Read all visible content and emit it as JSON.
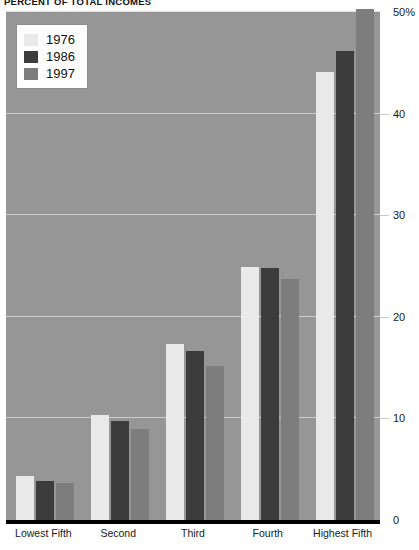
{
  "chart_data": {
    "type": "bar",
    "title": "PERCENT OF TOTAL INCOMES",
    "xlabel": "",
    "ylabel": "",
    "ylim": [
      0,
      50
    ],
    "grid": true,
    "legend_position": "top-left",
    "categories": [
      "Lowest Fifth",
      "Second",
      "Third",
      "Fourth",
      "Highest Fifth"
    ],
    "series": [
      {
        "name": "1976",
        "color": "#e9e9e9",
        "values": [
          4.3,
          10.3,
          17.3,
          24.9,
          44.1
        ]
      },
      {
        "name": "1986",
        "color": "#3c3c3c",
        "values": [
          3.8,
          9.7,
          16.6,
          24.8,
          46.2
        ]
      },
      {
        "name": "1997",
        "color": "#7d7d7d",
        "values": [
          3.6,
          9.0,
          15.2,
          23.7,
          50.3
        ]
      }
    ],
    "y_ticks": [
      {
        "value": 0,
        "label": "0"
      },
      {
        "value": 10,
        "label": "10"
      },
      {
        "value": 20,
        "label": "20"
      },
      {
        "value": 30,
        "label": "30"
      },
      {
        "value": 40,
        "label": "40"
      },
      {
        "value": 50,
        "label": "50%"
      }
    ]
  },
  "legend": {
    "items": [
      {
        "label": "1976",
        "swatch": "c1976"
      },
      {
        "label": "1986",
        "swatch": "c1986"
      },
      {
        "label": "1997",
        "swatch": "c1997"
      }
    ]
  },
  "colors": {
    "plot_background": "#969696",
    "gridline": "#d8d8d8",
    "axis": "#000000",
    "series_1976": "#e9e9e9",
    "series_1986": "#3c3c3c",
    "series_1997": "#7d7d7d"
  }
}
